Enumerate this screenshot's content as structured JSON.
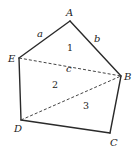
{
  "diagram": {
    "type": "pentagon-partition",
    "vertices": {
      "A": {
        "label": "A",
        "x": 70,
        "y": 21
      },
      "B": {
        "label": "B",
        "x": 121,
        "y": 76
      },
      "C": {
        "label": "C",
        "x": 110,
        "y": 133
      },
      "D": {
        "label": "D",
        "x": 21,
        "y": 120
      },
      "E": {
        "label": "E",
        "x": 19,
        "y": 58
      }
    },
    "edges": [
      {
        "from": "A",
        "to": "B",
        "label": "b",
        "style": "solid"
      },
      {
        "from": "B",
        "to": "C",
        "label": "",
        "style": "solid"
      },
      {
        "from": "C",
        "to": "D",
        "label": "",
        "style": "solid"
      },
      {
        "from": "D",
        "to": "E",
        "label": "",
        "style": "solid"
      },
      {
        "from": "E",
        "to": "A",
        "label": "a",
        "style": "solid"
      }
    ],
    "diagonals": [
      {
        "from": "E",
        "to": "B",
        "label": "c",
        "style": "dashed"
      },
      {
        "from": "D",
        "to": "B",
        "label": "",
        "style": "dashed"
      }
    ],
    "edge_labels": {
      "a": "a",
      "b": "b",
      "c": "c"
    },
    "regions": {
      "r1": "1",
      "r2": "2",
      "r3": "3"
    },
    "colors": {
      "line": "#2a2a2a",
      "text": "#222222",
      "background": "#ffffff"
    }
  }
}
